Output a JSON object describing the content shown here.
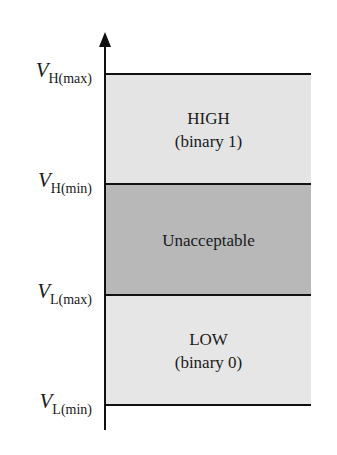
{
  "diagram": {
    "type": "logic-level-voltage-ranges",
    "colors": {
      "high_band": "#e4e4e4",
      "unacceptable_band": "#b8b8b8",
      "low_band": "#e6e6e6",
      "lines": "#111111"
    },
    "levels": [
      {
        "v": "V",
        "sub": "H(max)"
      },
      {
        "v": "V",
        "sub": "H(min)"
      },
      {
        "v": "V",
        "sub": "L(max)"
      },
      {
        "v": "V",
        "sub": "L(min)"
      }
    ],
    "bands": {
      "high": {
        "title": "HIGH",
        "subtitle": "(binary 1)"
      },
      "unacceptable": {
        "title": "Unacceptable"
      },
      "low": {
        "title": "LOW",
        "subtitle": "(binary 0)"
      }
    }
  }
}
